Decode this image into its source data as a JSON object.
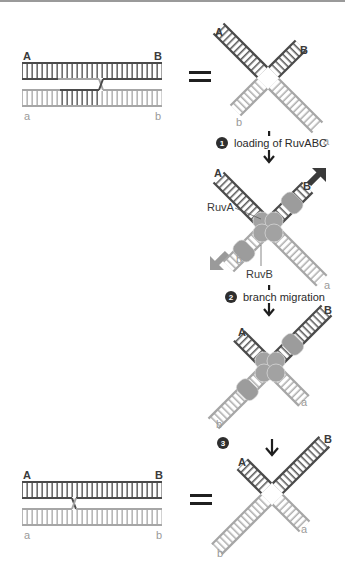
{
  "diagram": {
    "title": "",
    "colors": {
      "strand_dark": "#4a4a4a",
      "strand_light": "#a6a6a6",
      "protein": "#9c9c9c",
      "arrow": "#1e1e1e",
      "migration_arrow_dark": "#3a3a3a",
      "migration_arrow_light": "#9a9a9a",
      "badge": "#2e2e2e"
    },
    "panels": {
      "top_left": {
        "label_A": "A",
        "label_B": "B",
        "label_a": "a",
        "label_b": "b",
        "equals": "="
      },
      "top_right": {
        "label_A": "A",
        "label_B": "B",
        "label_a": "a",
        "label_b": "b"
      },
      "step1": {
        "number": "1",
        "text": "loading of RuvABC"
      },
      "middle1": {
        "label_A": "A",
        "label_B": "B",
        "label_a": "a",
        "label_b": "b",
        "ruvA": "RuvA",
        "ruvB": "RuvB"
      },
      "step2": {
        "number": "2",
        "text": "branch migration"
      },
      "middle2": {
        "label_A": "A",
        "label_B": "B",
        "label_a": "a",
        "label_b": "b"
      },
      "step3": {
        "number": "3",
        "text": ""
      },
      "bottom_left": {
        "label_A": "A",
        "label_B": "B",
        "label_a": "a",
        "label_b": "b",
        "equals": "="
      },
      "bottom_right": {
        "label_A": "A",
        "label_B": "B",
        "label_a": "a",
        "label_b": "b"
      }
    }
  }
}
